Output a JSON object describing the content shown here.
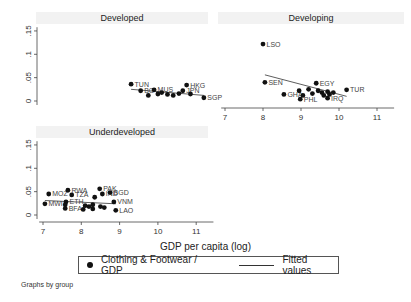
{
  "chart_data": {
    "type": "scatter",
    "layout": "faceted by group (3 panels), shared axes",
    "xlabel": "GDP per capita (log)",
    "ylabel": "",
    "xlim": [
      6.9,
      11.5
    ],
    "ylim": [
      -0.005,
      0.16
    ],
    "xticks": [
      7,
      8,
      9,
      10,
      11
    ],
    "yticks": [
      0,
      0.05,
      0.1,
      0.15
    ],
    "ytick_labels": [
      "0",
      ".05",
      ".1",
      ".15"
    ],
    "grid": false,
    "legend": {
      "position": "bottom",
      "entries": [
        "Clothing & Footwear / GDP",
        "Fitted values"
      ]
    },
    "note": "Graphs by group",
    "panels": [
      {
        "title": "Developed",
        "points": [
          {
            "label": "TUN",
            "x": 9.3,
            "y": 0.036
          },
          {
            "label": "BG",
            "x": 9.55,
            "y": 0.022
          },
          {
            "label": "MUS",
            "x": 9.9,
            "y": 0.024
          },
          {
            "label": "",
            "x": 9.75,
            "y": 0.012
          },
          {
            "label": "",
            "x": 10.0,
            "y": 0.015
          },
          {
            "label": "",
            "x": 10.1,
            "y": 0.018
          },
          {
            "label": "",
            "x": 10.25,
            "y": 0.014
          },
          {
            "label": "",
            "x": 10.4,
            "y": 0.012
          },
          {
            "label": "",
            "x": 10.55,
            "y": 0.016
          },
          {
            "label": "HKG",
            "x": 10.75,
            "y": 0.034
          },
          {
            "label": "JPN",
            "x": 10.65,
            "y": 0.022
          },
          {
            "label": "",
            "x": 10.85,
            "y": 0.015
          },
          {
            "label": "SGP",
            "x": 11.2,
            "y": 0.007
          }
        ],
        "fit": {
          "x": [
            9.3,
            11.2
          ],
          "y": [
            0.025,
            0.012
          ]
        }
      },
      {
        "title": "Developing",
        "points": [
          {
            "label": "LSO",
            "x": 8.0,
            "y": 0.122
          },
          {
            "label": "SEN",
            "x": 8.05,
            "y": 0.04
          },
          {
            "label": "GHA",
            "x": 8.55,
            "y": 0.014
          },
          {
            "label": "EGY",
            "x": 9.4,
            "y": 0.038
          },
          {
            "label": "TUR",
            "x": 10.2,
            "y": 0.024
          },
          {
            "label": "",
            "x": 8.95,
            "y": 0.022
          },
          {
            "label": "",
            "x": 9.05,
            "y": 0.012
          },
          {
            "label": "PHL",
            "x": 8.98,
            "y": 0.004
          },
          {
            "label": "",
            "x": 9.2,
            "y": 0.025
          },
          {
            "label": "",
            "x": 9.3,
            "y": 0.016
          },
          {
            "label": "",
            "x": 9.45,
            "y": 0.022
          },
          {
            "label": "",
            "x": 9.55,
            "y": 0.018
          },
          {
            "label": "",
            "x": 9.6,
            "y": 0.012
          },
          {
            "label": "",
            "x": 9.7,
            "y": 0.02
          },
          {
            "label": "",
            "x": 9.75,
            "y": 0.014
          },
          {
            "label": "",
            "x": 9.85,
            "y": 0.018
          },
          {
            "label": "IRQ",
            "x": 9.7,
            "y": 0.006
          }
        ],
        "fit": {
          "x": [
            8.05,
            10.2
          ],
          "y": [
            0.056,
            0.01
          ]
        }
      },
      {
        "title": "Underdeveloped",
        "points": [
          {
            "label": "MOZ",
            "x": 7.15,
            "y": 0.045
          },
          {
            "label": "MWI",
            "x": 7.05,
            "y": 0.024
          },
          {
            "label": "RWA",
            "x": 7.65,
            "y": 0.053
          },
          {
            "label": "TZA",
            "x": 7.75,
            "y": 0.043
          },
          {
            "label": "ETH",
            "x": 7.6,
            "y": 0.028
          },
          {
            "label": "",
            "x": 7.58,
            "y": 0.022
          },
          {
            "label": "BFA",
            "x": 7.58,
            "y": 0.014
          },
          {
            "label": "",
            "x": 8.05,
            "y": 0.012
          },
          {
            "label": "",
            "x": 8.1,
            "y": 0.02
          },
          {
            "label": "",
            "x": 8.2,
            "y": 0.018
          },
          {
            "label": "",
            "x": 8.3,
            "y": 0.022
          },
          {
            "label": "",
            "x": 8.35,
            "y": 0.038
          },
          {
            "label": "",
            "x": 8.3,
            "y": 0.013
          },
          {
            "label": "PAK",
            "x": 8.48,
            "y": 0.056
          },
          {
            "label": "IND",
            "x": 8.55,
            "y": 0.045
          },
          {
            "label": "BGD",
            "x": 8.75,
            "y": 0.048
          },
          {
            "label": "",
            "x": 8.5,
            "y": 0.018
          },
          {
            "label": "",
            "x": 8.6,
            "y": 0.016
          },
          {
            "label": "VNM",
            "x": 8.85,
            "y": 0.028
          },
          {
            "label": "LAO",
            "x": 8.9,
            "y": 0.01
          }
        ],
        "fit": {
          "x": [
            7.05,
            8.9
          ],
          "y": [
            0.031,
            0.024
          ]
        }
      }
    ]
  },
  "axis": {
    "y_ticks": [
      "0",
      ".05",
      ".1",
      ".15"
    ],
    "x_ticks": [
      "7",
      "8",
      "9",
      "10",
      "11"
    ],
    "x_label": "GDP per capita (log)"
  },
  "legend": {
    "scatter_label": "Clothing & Footwear / GDP",
    "fit_label": "Fitted values"
  },
  "note": "Graphs by group"
}
